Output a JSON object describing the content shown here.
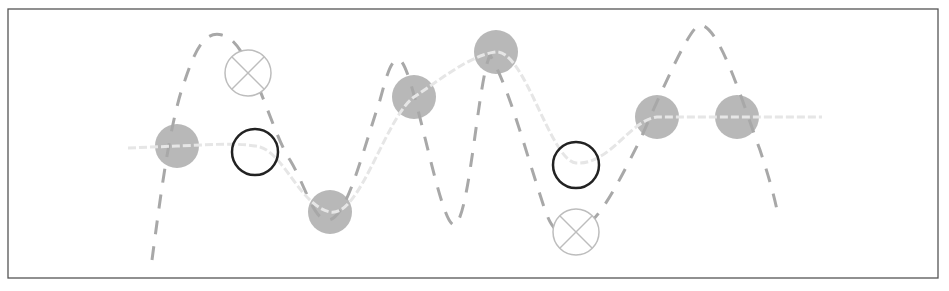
{
  "diagram": {
    "type": "interpolation-illustration",
    "frame": {
      "x": 8,
      "y": 9,
      "w": 930,
      "h": 269,
      "stroke": "#555555"
    },
    "colors": {
      "data_point": "#b8b8b8",
      "smooth_curve": "#e6e6e6",
      "dashed_curve": "#a8a8a8",
      "open_circle": "#222222",
      "x_circle": "#bdbdbd"
    },
    "data_points": [
      {
        "x": 177,
        "y": 146
      },
      {
        "x": 330,
        "y": 212
      },
      {
        "x": 414,
        "y": 97
      },
      {
        "x": 496,
        "y": 52
      },
      {
        "x": 657,
        "y": 117
      },
      {
        "x": 737,
        "y": 117
      }
    ],
    "open_circles": [
      {
        "x": 255,
        "y": 152
      },
      {
        "x": 576,
        "y": 165
      }
    ],
    "x_circles": [
      {
        "x": 248,
        "y": 73
      },
      {
        "x": 576,
        "y": 232
      }
    ],
    "smooth_curve_path": "M 128 148 L 177 146 C 205 145, 240 142, 260 147 C 285 155, 300 205, 330 212 C 360 218, 385 118, 414 97 C 440 80, 470 55, 496 52 C 525 50, 550 160, 576 163 C 610 165, 630 120, 657 117 L 737 117 L 822 117",
    "dashed_curve_path": "M 152 260 C 160 200, 170 120, 185 80 C 195 50, 205 30, 222 35 C 250 40, 270 130, 290 160 C 305 185, 312 215, 325 220 C 345 225, 360 160, 380 100 C 388 70, 392 58, 400 60 C 415 70, 440 230, 455 225 C 470 215, 478 80, 490 55 C 510 90, 525 150, 545 210 C 552 230, 560 238, 575 232 C 595 228, 615 190, 640 140 C 660 95, 690 25, 700 25 C 720 25, 745 110, 760 150 C 770 180, 775 200, 777 210",
    "labels": []
  }
}
